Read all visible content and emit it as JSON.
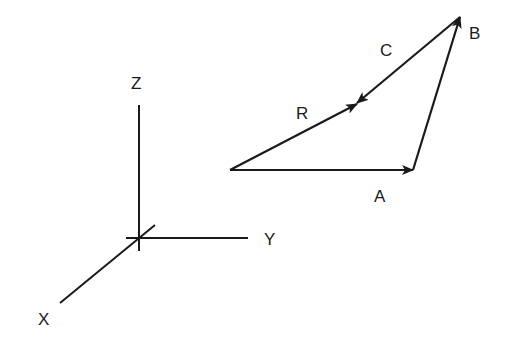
{
  "diagram": {
    "type": "vector-addition",
    "axes": {
      "labels": {
        "x": "X",
        "y": "Y",
        "z": "Z"
      }
    },
    "vectors": {
      "a": {
        "label": "A"
      },
      "b": {
        "label": "B"
      },
      "c": {
        "label": "C"
      },
      "r": {
        "label": "R"
      }
    },
    "colors": {
      "stroke": "#1a1a1a",
      "background": "#ffffff"
    }
  }
}
